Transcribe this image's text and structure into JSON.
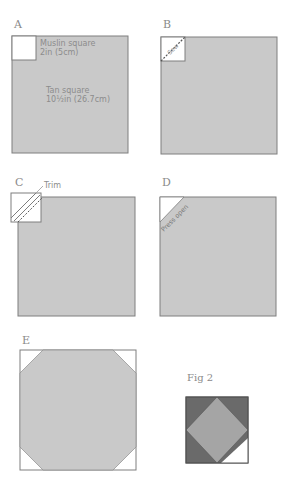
{
  "colors": {
    "tan": "#c9c9c9",
    "outline": "#7e7e7e",
    "muslin": "#ffffff",
    "dark": "#6a6a6a",
    "mid": "#a5a5a5"
  },
  "steps": {
    "a": {
      "label": "A",
      "muslin_note_1": "Muslin square",
      "muslin_note_2": "2in (5cm)",
      "tan_note_1": "Tan square",
      "tan_note_2": "10½in (26.7cm)"
    },
    "b": {
      "label": "B",
      "sew_note": "Sew"
    },
    "c": {
      "label": "C",
      "trim_note": "Trim"
    },
    "d": {
      "label": "D",
      "press_note": "Press open"
    },
    "e": {
      "label": "E"
    }
  },
  "figure": {
    "label": "Fig 2"
  }
}
